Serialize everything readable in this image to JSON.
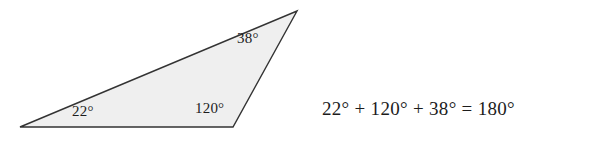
{
  "figure": {
    "type": "geometry-diagram",
    "background_color": "#ffffff"
  },
  "triangle": {
    "name": "scalene-triangle",
    "fill_color": "#efefef",
    "stroke_color": "#333333",
    "stroke_width": 1.4,
    "vertices": [
      {
        "name": "left-vertex",
        "x": 20,
        "y": 127
      },
      {
        "name": "apex-vertex",
        "x": 297,
        "y": 11
      },
      {
        "name": "bottom-right-vertex",
        "x": 233,
        "y": 127
      }
    ],
    "points_attr": "20,127 297,11 233,127"
  },
  "angles": {
    "left": {
      "label": "22°",
      "value": 22,
      "unit": "degrees",
      "vertex": "left-vertex"
    },
    "bottom": {
      "label": "120°",
      "value": 120,
      "unit": "degrees",
      "vertex": "bottom-right-vertex"
    },
    "apex": {
      "label": "38°",
      "value": 38,
      "unit": "degrees",
      "vertex": "apex-vertex"
    }
  },
  "equation": {
    "text": "22° + 120° + 38° = 180°",
    "terms": [
      "22°",
      "120°",
      "38°"
    ],
    "sum": "180°"
  }
}
